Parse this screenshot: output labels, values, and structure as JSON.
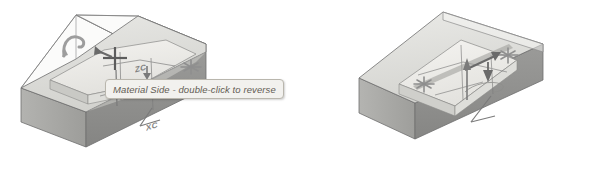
{
  "scene": {
    "background": "#ffffff",
    "type": "cad-isometric-diagram",
    "figure_count": 2
  },
  "colors": {
    "top_face": "#dcdcd8",
    "top_face_light": "#ececeb",
    "front_face": "#8d8d8d",
    "side_face": "#a9a9a6",
    "pocket_floor": "#f0efec",
    "pocket_wall": "#c6c6c2",
    "outline": "#6e6e6e",
    "marker": "#8f8f8f",
    "tooltip_bg": "#f2f1ee",
    "tooltip_border": "#b9b6ad",
    "tooltip_text": "#555047",
    "axis_text": "#6f6f6f"
  },
  "figures": [
    {
      "id": "left",
      "name": "material-side-figure",
      "description": "Isometric block with open pocket, material side indicator selected",
      "tooltip": {
        "visible": true,
        "text": "Material Side - double-click to reverse"
      },
      "axis_labels": [
        {
          "name": "zc",
          "text": "ZC"
        },
        {
          "name": "xc",
          "text": "XC"
        }
      ],
      "markers": [
        {
          "name": "rotate-handle-icon",
          "kind": "curved-arrow"
        },
        {
          "name": "crosshair-cursor-icon",
          "kind": "crosshair"
        },
        {
          "name": "direction-arrow-icon",
          "kind": "arrow"
        },
        {
          "name": "asterisk-point-marker",
          "kind": "asterisk"
        },
        {
          "name": "asterisk-point-marker",
          "kind": "asterisk"
        },
        {
          "name": "down-arrow-marker",
          "kind": "arrow-down"
        }
      ]
    },
    {
      "id": "right",
      "name": "reversed-material-side-figure",
      "description": "Isometric block with pocket and reversed material side direction arrows",
      "tooltip": {
        "visible": false,
        "text": ""
      },
      "axis_labels": [
        {
          "name": "zc",
          "text": "ZC"
        },
        {
          "name": "xc",
          "text": "XC"
        }
      ],
      "markers": [
        {
          "name": "asterisk-point-marker",
          "kind": "asterisk"
        },
        {
          "name": "asterisk-point-marker",
          "kind": "asterisk"
        },
        {
          "name": "direction-arrow-icon",
          "kind": "arrow"
        },
        {
          "name": "down-arrow-marker",
          "kind": "arrow-down"
        },
        {
          "name": "axis-arrow-up-icon",
          "kind": "arrow-up"
        }
      ]
    }
  ]
}
